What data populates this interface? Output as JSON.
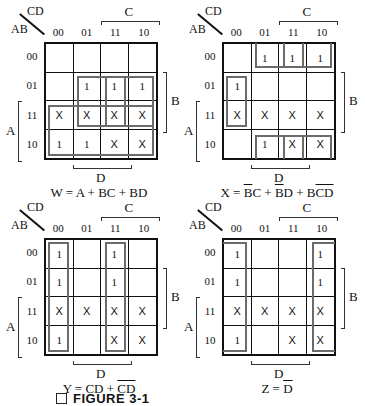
{
  "figure": {
    "caption_marker": "□",
    "caption": "FIGURE 3-1"
  },
  "axes": {
    "corner_top": "CD",
    "corner_left": "AB",
    "col_labels": [
      "00",
      "01",
      "11",
      "10"
    ],
    "row_labels": [
      "00",
      "01",
      "11",
      "10"
    ],
    "var_C": "C",
    "var_D": "D",
    "var_A": "A",
    "var_B": "B"
  },
  "colors": {
    "grid": "#111111",
    "group_outline": "#6b6b6b",
    "background": "#ffffff"
  },
  "maps": [
    {
      "id": "W",
      "position": {
        "left": 0,
        "top": 0
      },
      "cells": [
        [
          "",
          "",
          "",
          ""
        ],
        [
          "",
          "1",
          "1",
          "1"
        ],
        [
          "X",
          "X",
          "X",
          "X"
        ],
        [
          "1",
          "1",
          "X",
          "X"
        ]
      ],
      "equation_parts": [
        {
          "t": "W = A + BC + BD",
          "ol": false
        }
      ],
      "groups": [
        {
          "name": "group-A",
          "r0": 2,
          "c0": 0,
          "r1": 3,
          "c1": 3,
          "open": []
        },
        {
          "name": "group-BC",
          "r0": 1,
          "c0": 2,
          "r1": 2,
          "c1": 3,
          "open": []
        },
        {
          "name": "group-BD",
          "r0": 1,
          "c0": 1,
          "r1": 2,
          "c1": 2,
          "open": []
        }
      ]
    },
    {
      "id": "X",
      "position": {
        "left": 178,
        "top": 0
      },
      "cells": [
        [
          "",
          "1",
          "1",
          "1"
        ],
        [
          "1",
          "",
          "",
          ""
        ],
        [
          "X",
          "X",
          "X",
          "X"
        ],
        [
          "",
          "1",
          "X",
          "X"
        ]
      ],
      "equation_parts": [
        {
          "t": "X = ",
          "ol": false
        },
        {
          "t": "B",
          "ol": true
        },
        {
          "t": "C + ",
          "ol": false
        },
        {
          "t": "B",
          "ol": true
        },
        {
          "t": "D + B",
          "ol": false
        },
        {
          "t": "CD",
          "ol": true
        }
      ],
      "groups": [
        {
          "name": "group-Bbar-D-top",
          "r0": 0,
          "c0": 1,
          "r1": 0,
          "c1": 2,
          "open": [
            "top"
          ]
        },
        {
          "name": "group-Bbar-C-top",
          "r0": 0,
          "c0": 2,
          "r1": 0,
          "c1": 3,
          "open": [
            "top"
          ]
        },
        {
          "name": "group-Bbar-D-bottom",
          "r0": 3,
          "c0": 1,
          "r1": 3,
          "c1": 2,
          "open": [
            "bottom"
          ]
        },
        {
          "name": "group-Bbar-C-bottom",
          "r0": 3,
          "c0": 2,
          "r1": 3,
          "c1": 3,
          "open": [
            "bottom"
          ]
        },
        {
          "name": "group-B-Cbar-Dbar",
          "r0": 1,
          "c0": 0,
          "r1": 2,
          "c1": 0,
          "open": []
        }
      ]
    },
    {
      "id": "Y",
      "position": {
        "left": 0,
        "top": 196
      },
      "cells": [
        [
          "1",
          "",
          "1",
          ""
        ],
        [
          "1",
          "",
          "1",
          ""
        ],
        [
          "X",
          "X",
          "X",
          "X"
        ],
        [
          "1",
          "",
          "X",
          "X"
        ]
      ],
      "equation_parts": [
        {
          "t": "Y = CD + ",
          "ol": false
        },
        {
          "t": "CD",
          "ol": true
        }
      ],
      "groups": [
        {
          "name": "group-Cbar-Dbar",
          "r0": 0,
          "c0": 0,
          "r1": 3,
          "c1": 0,
          "open": []
        },
        {
          "name": "group-CD",
          "r0": 0,
          "c0": 2,
          "r1": 3,
          "c1": 2,
          "open": []
        }
      ]
    },
    {
      "id": "Z",
      "position": {
        "left": 178,
        "top": 196
      },
      "cells": [
        [
          "1",
          "",
          "",
          "1"
        ],
        [
          "1",
          "",
          "",
          "1"
        ],
        [
          "X",
          "X",
          "X",
          "X"
        ],
        [
          "1",
          "",
          "X",
          "X"
        ]
      ],
      "equation_parts": [
        {
          "t": "Z = ",
          "ol": false
        },
        {
          "t": "D",
          "ol": true
        }
      ],
      "groups": [
        {
          "name": "group-Dbar-left",
          "r0": 0,
          "c0": 0,
          "r1": 3,
          "c1": 0,
          "open": [
            "left"
          ]
        },
        {
          "name": "group-Dbar-right",
          "r0": 0,
          "c0": 3,
          "r1": 3,
          "c1": 3,
          "open": [
            "right"
          ]
        }
      ]
    }
  ]
}
